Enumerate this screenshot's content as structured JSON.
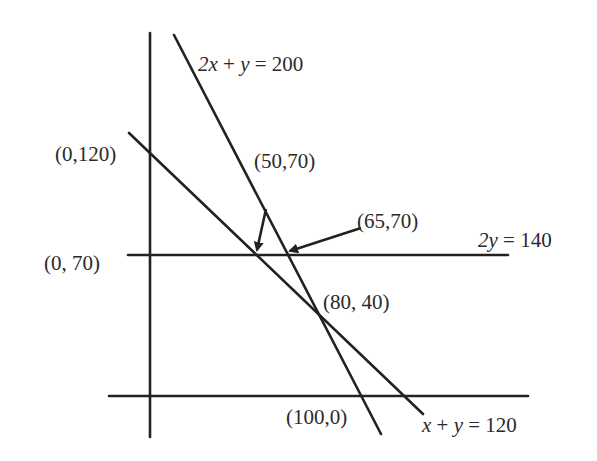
{
  "diagram": {
    "type": "linear-constraints-graph",
    "colors": {
      "ink": "#222222",
      "background": "#ffffff"
    },
    "lines": [
      {
        "id": "line-2x-y-200",
        "equation": {
          "var1": "2x",
          "op1": " + ",
          "var2": "y",
          "rest": " = 200"
        }
      },
      {
        "id": "line-x-y-120",
        "equation": {
          "var1": "x",
          "op1": " + ",
          "var2": "y",
          "rest": " = 120"
        }
      },
      {
        "id": "line-2y-140",
        "equation": {
          "var1": "2y",
          "rest": " = 140"
        }
      }
    ],
    "points": {
      "p_0_120": "(0,120)",
      "p_0_70": "(0, 70)",
      "p_50_70": "(50,70)",
      "p_65_70": "(65,70)",
      "p_80_40": "(80, 40)",
      "p_100_0": "(100,0)"
    }
  }
}
